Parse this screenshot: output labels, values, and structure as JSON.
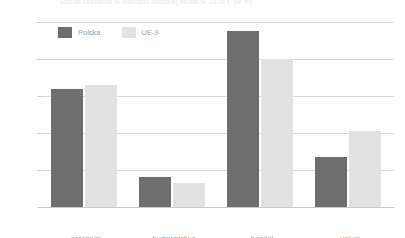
{
  "caption": "Udział sektorów w wartości dodanej brutto w 2019 r. (w %)",
  "legend": {
    "position": "top-left",
    "items": [
      {
        "label": "Polska",
        "color": "#6e6e6e",
        "swatch": "polska"
      },
      {
        "label": "UE-9",
        "color": "#e2e2e2",
        "swatch": "ue"
      }
    ]
  },
  "axis": {
    "ticks": [
      "0%",
      "10%",
      "20%",
      "30%",
      "40%",
      "50%"
    ],
    "values": [
      0,
      10,
      20,
      30,
      40,
      50
    ]
  },
  "chart_data": {
    "type": "bar",
    "title": "Udział sektorów w wartości dodanej brutto w 2019 r. (w %)",
    "xlabel": "",
    "ylabel": "",
    "ylim": [
      0,
      50
    ],
    "ytick_labels": [
      "0%",
      "10%",
      "20%",
      "30%",
      "40%",
      "50%"
    ],
    "ytick_values": [
      0,
      10,
      20,
      30,
      40,
      50
    ],
    "grid": true,
    "legend_position": "top-left",
    "categories": [
      "przemysł",
      "budownictwo",
      "handel",
      "usługi"
    ],
    "series": [
      {
        "name": "Polska",
        "color": "#6e6e6e",
        "values": [
          32.0,
          8.0,
          47.5,
          13.5
        ]
      },
      {
        "name": "UE-9",
        "color": "#e2e2e2",
        "values": [
          33.0,
          6.5,
          40.0,
          20.5
        ]
      }
    ]
  }
}
